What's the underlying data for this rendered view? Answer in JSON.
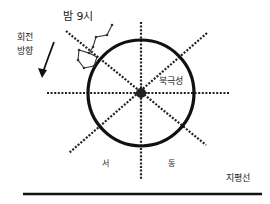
{
  "diagram": {
    "labels": {
      "time": "밤 9시",
      "rotation_line1": "회전",
      "rotation_line2": "방향",
      "polaris": "북극성",
      "west": "서",
      "east": "동",
      "horizon": "지평선"
    },
    "elements": {
      "circle": {
        "cx": 141,
        "cy": 93,
        "r": 53,
        "stroke": "#111111"
      },
      "center_star": {
        "name": "polaris",
        "cx": 141,
        "cy": 93
      },
      "axis_lines": [
        {
          "name": "vertical",
          "x1": 141,
          "y1": 22,
          "x2": 141,
          "y2": 180
        },
        {
          "name": "horizontal",
          "x1": 47,
          "y1": 93,
          "x2": 230,
          "y2": 93
        },
        {
          "name": "nw-se",
          "x1": 66,
          "y1": 31,
          "x2": 206,
          "y2": 145
        },
        {
          "name": "ne-sw",
          "x1": 207,
          "y1": 33,
          "x2": 69,
          "y2": 153
        }
      ],
      "horizon_line": {
        "x1": 23,
        "y1": 194,
        "x2": 262,
        "y2": 194
      },
      "constellation": {
        "name": "북두칠성",
        "points": [
          [
            112,
            25
          ],
          [
            107,
            35
          ],
          [
            96,
            37
          ],
          [
            93,
            47
          ],
          [
            89,
            53
          ],
          [
            79,
            50
          ],
          [
            78,
            60
          ],
          [
            84,
            68
          ],
          [
            94,
            66
          ],
          [
            97,
            57
          ],
          [
            89,
            53
          ]
        ]
      },
      "rotation_arrow": {
        "direction": "counter-clockwise",
        "from": [
          54,
          42
        ],
        "to": [
          42,
          75
        ]
      }
    }
  }
}
